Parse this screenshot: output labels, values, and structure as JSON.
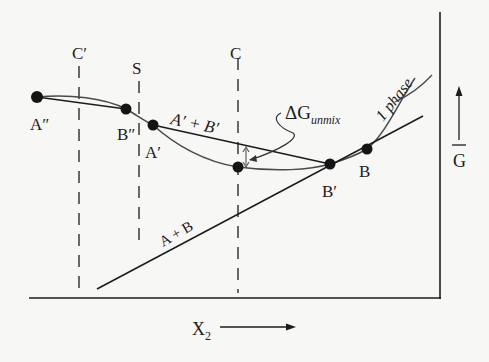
{
  "diagram": {
    "type": "free-energy-composition diagram",
    "axes": {
      "x_label": "X",
      "x_label_sub": "2",
      "y_label": "G"
    },
    "vertical_markers": [
      {
        "id": "c-prime",
        "label": "C′"
      },
      {
        "id": "s",
        "label": "S"
      },
      {
        "id": "c",
        "label": "C"
      }
    ],
    "points": [
      {
        "id": "a-double-prime",
        "label": "A″"
      },
      {
        "id": "b-double-prime",
        "label": "B″"
      },
      {
        "id": "a-prime",
        "label": "A′"
      },
      {
        "id": "b-prime",
        "label": "B′"
      },
      {
        "id": "b",
        "label": "B"
      }
    ],
    "line_labels": {
      "tangent_ab": "A + B",
      "tangent_apbp": "A′ + B′",
      "one_phase": "1 phase"
    },
    "annotation": {
      "delta_g": "ΔG",
      "delta_g_sub": "unmix"
    },
    "colors": {
      "ink": "#1c1c1c",
      "curve": "#4a4a4a",
      "background": "#f7f7f5"
    }
  }
}
